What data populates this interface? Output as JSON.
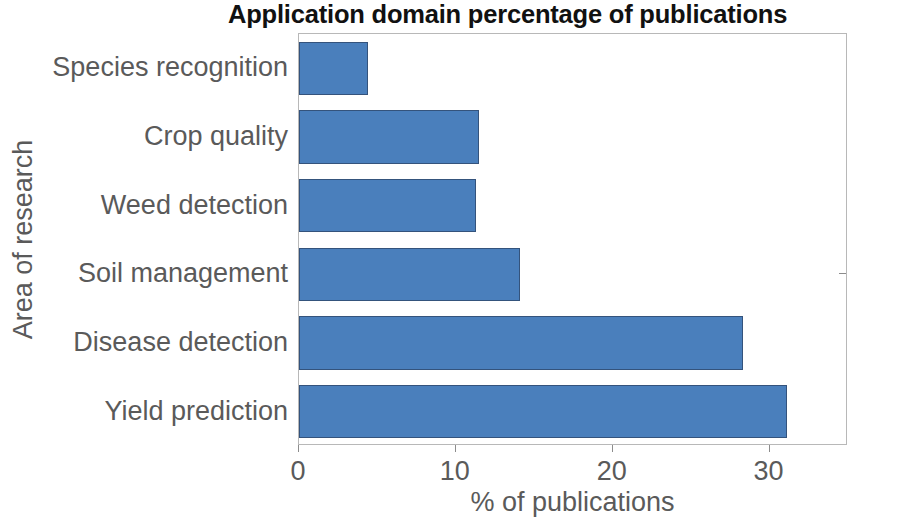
{
  "chart_data": {
    "type": "bar",
    "orientation": "horizontal",
    "title": "Application domain percentage of publications",
    "xlabel": "% of publications",
    "ylabel": "Area of research",
    "categories": [
      "Species recognition",
      "Crop quality",
      "Weed detection",
      "Soil management",
      "Disease detection",
      "Yield prediction"
    ],
    "values": [
      4.4,
      11.5,
      11.3,
      14.1,
      28.3,
      31.1
    ],
    "xlim": [
      0,
      35
    ],
    "xticks": [
      0,
      10,
      20,
      30
    ],
    "xticklabels": [
      "0",
      "10",
      "20",
      "30"
    ],
    "grid": false,
    "legend": null,
    "bar_color": "#4a7fbc",
    "bar_edge_color": "#34537c",
    "axis_color": "#b8b8b8",
    "tick_label_color": "#5a5a5a",
    "title_color": "#111111"
  }
}
